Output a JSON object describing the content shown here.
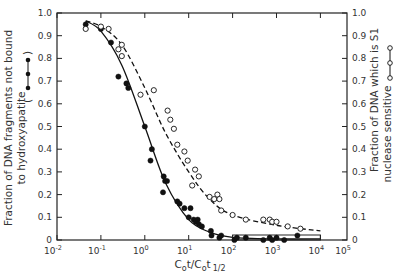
{
  "chart_data": {
    "type": "scatter",
    "title": "",
    "xlabel": "Cot/Cot 1/2",
    "xlabel_parts": {
      "main": "C",
      "sub0": "o",
      "t": "t/C",
      "sub1": "o",
      "t2": "t",
      "sub2": "1/2"
    },
    "ylabel_left": [
      "Fraction of DNA fragments not bound",
      "to hydroxyapatite"
    ],
    "ylabel_right": [
      "Fraction of DNA which is S1",
      "nuclease sensitive"
    ],
    "x_scale": "log",
    "xlim_log10": [
      -2,
      4.63
    ],
    "ylim": [
      0,
      1.0
    ],
    "x_ticks": [
      "10-2",
      "10-1",
      "100",
      "101",
      "102",
      "103",
      "104",
      "105"
    ],
    "x_tick_exponents": [
      -2,
      -1,
      0,
      1,
      2,
      3,
      4,
      5
    ],
    "y_ticks": [
      "0",
      "0.1",
      "0.2",
      "0.3",
      "0.4",
      "0.5",
      "0.6",
      "0.7",
      "0.8",
      "0.9",
      "1.0"
    ],
    "grid": false,
    "series": [
      {
        "name": "Fraction of DNA fragments not bound to hydroxyapatite",
        "marker": "filled-circle",
        "curve": "solid",
        "x": [
          0.045,
          0.1,
          0.17,
          0.25,
          0.38,
          0.42,
          1.0,
          1.45,
          1.35,
          2.7,
          2.9,
          3.2,
          2.6,
          5.5,
          6.2,
          8.0,
          11.0,
          10.0,
          13.0,
          14.5,
          16.0,
          17.0,
          20.0,
          32.0,
          33.0,
          50.0,
          55.0,
          110.0,
          125.0,
          200.0,
          500.0,
          700.0,
          800.0,
          1000.0,
          1500.0,
          3000.0
        ],
        "y": [
          0.95,
          0.93,
          0.87,
          0.72,
          0.69,
          0.67,
          0.5,
          0.4,
          0.35,
          0.28,
          0.26,
          0.26,
          0.21,
          0.17,
          0.16,
          0.14,
          0.14,
          0.1,
          0.09,
          0.08,
          0.09,
          0.07,
          0.06,
          0.04,
          0.02,
          0.01,
          0.02,
          0.0,
          0.01,
          0.01,
          0.0,
          0.01,
          0.0,
          0.01,
          0.0,
          0.02
        ],
        "fit_x": [
          0.045,
          0.1,
          0.3,
          1.0,
          3.0,
          10.0,
          30.0,
          100.0,
          1000.0,
          10000.0
        ],
        "fit_y": [
          0.965,
          0.92,
          0.77,
          0.5,
          0.25,
          0.09,
          0.035,
          0.012,
          0.005,
          0.005
        ]
      },
      {
        "name": "Fraction of DNA which is S1 nuclease sensitive",
        "marker": "open-circle",
        "curve": "dashed",
        "x": [
          0.045,
          0.1,
          0.15,
          0.25,
          0.3,
          0.3,
          0.8,
          1.6,
          3.3,
          3.8,
          4.6,
          5.5,
          8.0,
          9.5,
          14.0,
          17.0,
          12.0,
          30.0,
          45.0,
          38.0,
          50.0,
          55.0,
          100.0,
          200.0,
          500.0,
          700.0,
          800.0,
          1000.0,
          1800.0,
          3500.0
        ],
        "y": [
          0.93,
          0.94,
          0.93,
          0.84,
          0.86,
          0.81,
          0.64,
          0.66,
          0.57,
          0.53,
          0.49,
          0.42,
          0.39,
          0.35,
          0.31,
          0.28,
          0.24,
          0.19,
          0.2,
          0.18,
          0.18,
          0.13,
          0.11,
          0.09,
          0.09,
          0.09,
          0.08,
          0.08,
          0.06,
          0.05
        ],
        "fit_x": [
          0.045,
          0.1,
          0.3,
          1.0,
          3.0,
          10.0,
          30.0,
          100.0,
          1000.0,
          10000.0
        ],
        "fit_y": [
          0.965,
          0.94,
          0.86,
          0.67,
          0.47,
          0.3,
          0.18,
          0.11,
          0.065,
          0.04
        ]
      }
    ],
    "annotations": {
      "bar_ranges": "horizontal open bars from ~10^2 to ~10^4 at y=0"
    }
  }
}
